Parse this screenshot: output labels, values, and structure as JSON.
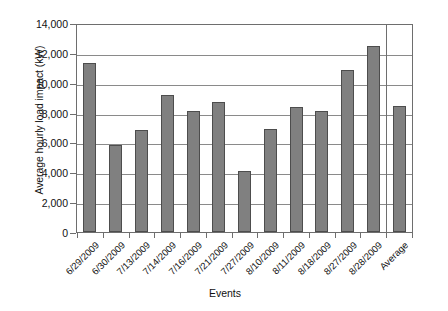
{
  "chart_data": {
    "type": "bar",
    "title": "",
    "xlabel": "Events",
    "ylabel": "Average hourly load impact (kW)",
    "categories": [
      "6/29/2009",
      "6/30/2009",
      "7/13/2009",
      "7/14/2009",
      "7/16/2009",
      "7/21/2009",
      "7/27/2009",
      "8/10/2009",
      "8/11/2009",
      "8/18/2009",
      "8/27/2009",
      "8/28/2009",
      "Average"
    ],
    "values": [
      11400,
      5900,
      6900,
      9250,
      8200,
      8800,
      4100,
      6950,
      8450,
      8150,
      10950,
      12600,
      8500
    ],
    "ylim": [
      0,
      14000
    ],
    "ytick_step": 2000,
    "yticks": [
      0,
      2000,
      4000,
      6000,
      8000,
      10000,
      12000,
      14000
    ],
    "ytick_labels": [
      "0",
      "2,000",
      "4,000",
      "6,000",
      "8,000",
      "10,000",
      "12,000",
      "14,000"
    ],
    "grid": "horizontal",
    "legend": "none",
    "bar_color": "#808080",
    "bar_edge_color": "#4d4d4d",
    "axis_color": "#6e6e6e",
    "separator_before_last_category": true
  }
}
